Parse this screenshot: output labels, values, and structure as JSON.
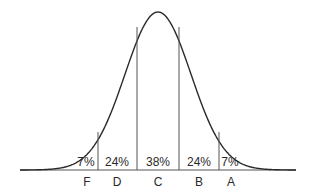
{
  "chart_data": {
    "type": "area",
    "title": "",
    "xlabel": "",
    "ylabel": "",
    "grid": false,
    "legend": null,
    "categories": [
      "F",
      "D",
      "C",
      "B",
      "A"
    ],
    "values": [
      7,
      24,
      38,
      24,
      7
    ],
    "value_labels": [
      "7%",
      "24%",
      "38%",
      "24%",
      "7%"
    ],
    "unit": "%"
  },
  "segments": [
    {
      "grade": "F",
      "percent": "7%"
    },
    {
      "grade": "D",
      "percent": "24%"
    },
    {
      "grade": "C",
      "percent": "38%"
    },
    {
      "grade": "B",
      "percent": "24%"
    },
    {
      "grade": "A",
      "percent": "7%"
    }
  ],
  "colors": {
    "curve": "#2a2a2a",
    "divider": "#555555",
    "baseline": "#555555",
    "text": "#2a2a2a",
    "background": "#ffffff"
  }
}
